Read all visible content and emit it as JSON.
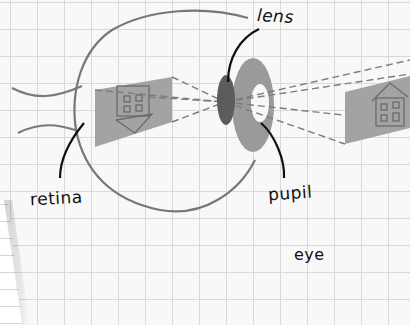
{
  "diagram": {
    "title": "eye",
    "labels": {
      "lens": "lens",
      "retina": "retina",
      "pupil": "pupil",
      "caption": "eye"
    },
    "parts": [
      {
        "name": "eyeball",
        "shape": "circle outline"
      },
      {
        "name": "optic-nerve",
        "shape": "two curved lines"
      },
      {
        "name": "retina-image",
        "shape": "grey panel with inverted house"
      },
      {
        "name": "lens",
        "shape": "dark grey ellipse"
      },
      {
        "name": "iris",
        "shape": "grey ring"
      },
      {
        "name": "pupil",
        "shape": "white hole in ring"
      },
      {
        "name": "object",
        "shape": "grey panel with upright house"
      },
      {
        "name": "light-rays",
        "shape": "dashed lines crossing at lens"
      }
    ],
    "colors": {
      "outline": "#7a7a7a",
      "lens": "#5c5c5c",
      "iris": "#9a9a9a",
      "panel": "#a3a3a3",
      "house": "#6a6a6a",
      "pointer": "#111111",
      "grid": "#d9d9d9",
      "paper": "#f8f8f8"
    }
  }
}
